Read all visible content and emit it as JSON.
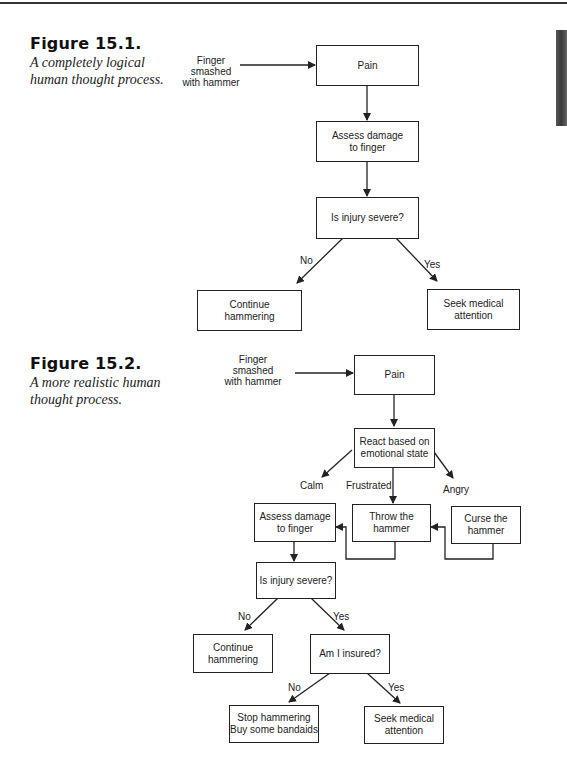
{
  "figures": [
    {
      "number": "Figure 15.1.",
      "description": "A completely logical human thought process.",
      "input_label": "Finger smashed\nwith hammer",
      "nodes": {
        "pain": "Pain",
        "assess": "Assess damage\nto finger",
        "decision": "Is injury severe?",
        "continue": "Continue\nhammering",
        "seek": "Seek medical\nattention"
      },
      "edge_labels": {
        "no": "No",
        "yes": "Yes"
      }
    },
    {
      "number": "Figure 15.2.",
      "description": "A more realistic human thought process.",
      "input_label": "Finger smashed\nwith hammer",
      "nodes": {
        "pain": "Pain",
        "react": "React based on\nemotional state",
        "assess": "Assess damage\nto finger",
        "throw": "Throw the\nhammer",
        "curse": "Curse the\nhammer",
        "decision": "Is injury severe?",
        "continue": "Continue\nhammering",
        "insured": "Am I insured?",
        "stop": "Stop hammering\nBuy some bandaids",
        "seek": "Seek medical\nattention"
      },
      "edge_labels": {
        "calm": "Calm",
        "frustrated": "Frustrated",
        "angry": "Angry",
        "no": "No",
        "yes": "Yes",
        "no2": "No",
        "yes2": "Yes"
      }
    }
  ]
}
